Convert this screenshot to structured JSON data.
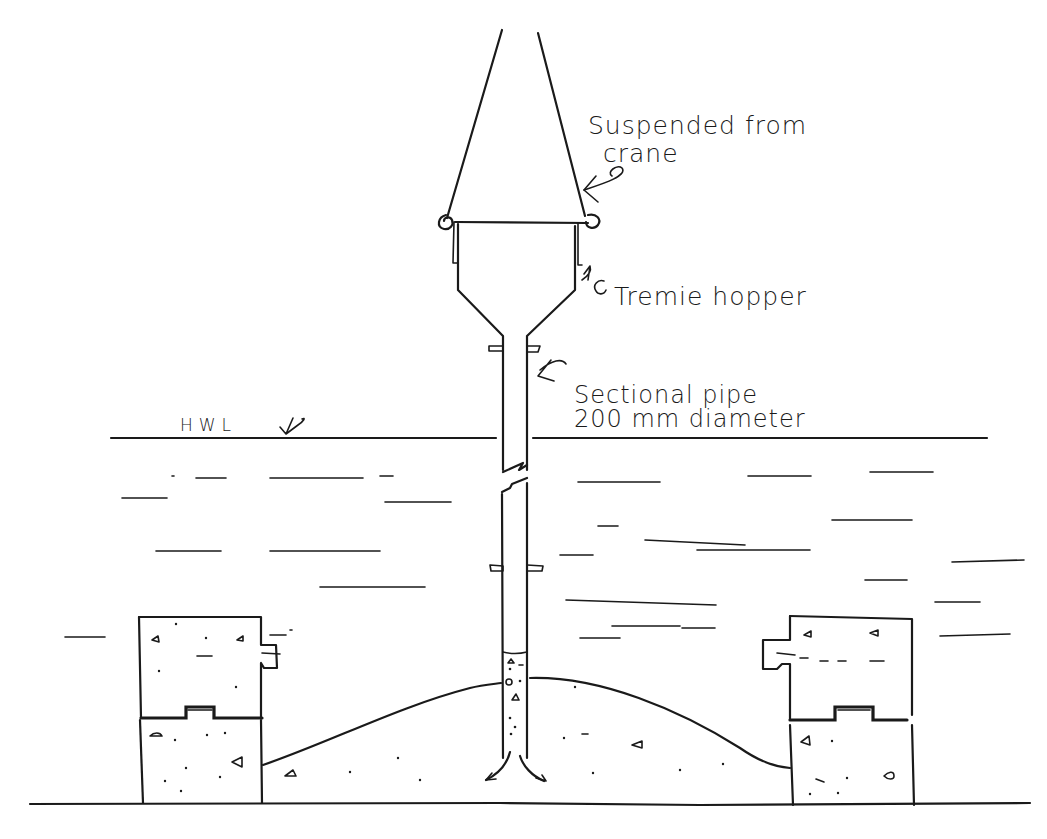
{
  "diagram": {
    "type": "engineering-sketch",
    "colors": {
      "ink": "#1a1a1a",
      "background": "#ffffff"
    },
    "labels": {
      "crane": {
        "line1": "Suspended from",
        "line2": "crane"
      },
      "hopper": "Tremie hopper",
      "pipe": {
        "line1": "Sectional pipe",
        "line2": "200 mm diameter"
      },
      "water_level": "HWL"
    },
    "components": [
      "crane-suspension-cables",
      "tremie-hopper",
      "sectional-pipe",
      "pipe-joint-flanges",
      "high-water-level-line",
      "water-surface-strokes",
      "precast-concrete-blocks-left",
      "precast-concrete-blocks-right",
      "concrete-mound",
      "seabed-line",
      "concrete-flow-arrows"
    ]
  }
}
